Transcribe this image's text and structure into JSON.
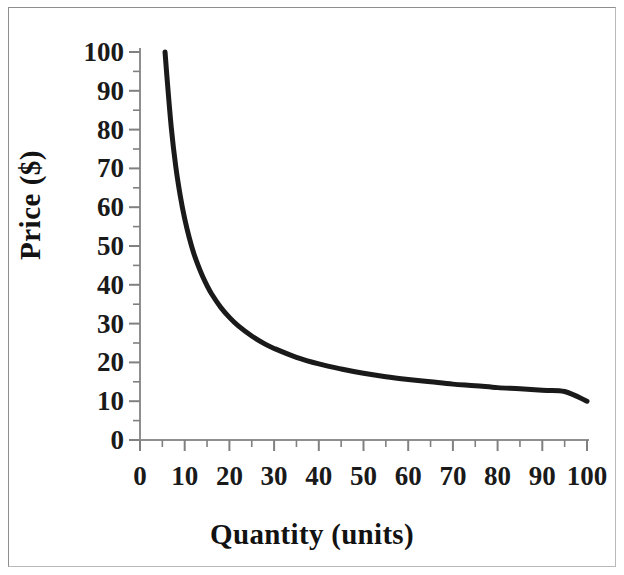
{
  "chart_data": {
    "type": "line",
    "title": "",
    "subtitle": "",
    "xlabel": "Quantity (units)",
    "ylabel": "Price ($)",
    "xlim": [
      0,
      100
    ],
    "ylim": [
      0,
      100
    ],
    "x_ticks": [
      0,
      10,
      20,
      30,
      40,
      50,
      60,
      70,
      80,
      90,
      100
    ],
    "y_ticks": [
      0,
      10,
      20,
      30,
      40,
      50,
      60,
      70,
      80,
      90,
      100
    ],
    "x_tick_labels": [
      "0",
      "10",
      "20",
      "30",
      "40",
      "50",
      "60",
      "70",
      "80",
      "90",
      "100"
    ],
    "y_tick_labels": [
      "0",
      "10",
      "20",
      "30",
      "40",
      "50",
      "60",
      "70",
      "80",
      "90",
      "100"
    ],
    "x_minor_tick_step": 5,
    "y_minor_tick_step": 5,
    "grid": false,
    "legend": null,
    "legend_position": "none",
    "series": [
      {
        "name": "Demand curve",
        "color": "#1a1a1a",
        "line_width": 5,
        "x": [
          5.6,
          6,
          7,
          8,
          9,
          10,
          11,
          12,
          13,
          14,
          15,
          16,
          18,
          20,
          22,
          25,
          28,
          30,
          35,
          40,
          45,
          50,
          55,
          60,
          65,
          70,
          75,
          80,
          85,
          90,
          95,
          100
        ],
        "y": [
          100,
          94,
          80.5,
          70.5,
          63,
          57,
          52.2,
          48.2,
          45,
          42.2,
          39.8,
          37.7,
          34.3,
          31.6,
          29.4,
          26.8,
          24.7,
          23.6,
          21.3,
          19.6,
          18.3,
          17.2,
          16.3,
          15.6,
          15,
          14.4,
          14,
          13.5,
          13.2,
          12.8,
          12.5,
          10
        ]
      }
    ],
    "annotations": []
  },
  "axes": {
    "y_title": "Price ($)",
    "x_title": "Quantity (units)"
  },
  "style": {
    "background": "#ffffff",
    "axis_color": "#808080",
    "curve_color": "#1a1a1a",
    "border_color": "#b9b9b9",
    "text_color": "#1a1a1a"
  }
}
